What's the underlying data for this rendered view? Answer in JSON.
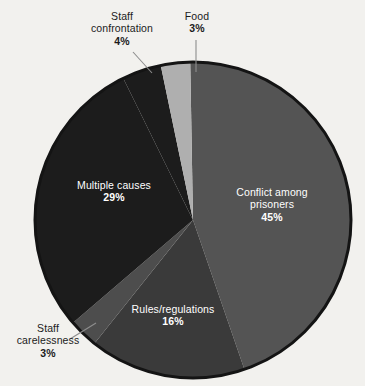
{
  "chart_data": {
    "type": "pie",
    "title": "",
    "subtitle": "",
    "xlabel": "",
    "ylabel": "",
    "legend": "none",
    "grid": false,
    "units": "percent",
    "center": {
      "cx": 193,
      "cy": 220,
      "r": 158
    },
    "start_angle_deg": -1,
    "direction": "clockwise",
    "categories": [
      "Conflict among prisoners",
      "Rules/regulations",
      "Staff carelessness",
      "Multiple causes",
      "Staff confrontation",
      "Food"
    ],
    "values": [
      45,
      16,
      3,
      29,
      4,
      3
    ],
    "slices": [
      {
        "label": "Conflict among\nprisoners",
        "name_line1": "Conflict among",
        "name_line2": "prisoners",
        "value": 45,
        "pct_text": "45%",
        "color": "#545454",
        "label_placement": "inside",
        "label_color": "#ffffff"
      },
      {
        "label": "Rules/regulations",
        "name_line1": "Rules/regulations",
        "name_line2": "",
        "value": 16,
        "pct_text": "16%",
        "color": "#3a3a3a",
        "label_placement": "inside",
        "label_color": "#ffffff"
      },
      {
        "label": "Staff carelessness",
        "name_line1": "Staff",
        "name_line2": "carelessness",
        "value": 3,
        "pct_text": "3%",
        "color": "#4d4d4d",
        "label_placement": "outside",
        "label_color": "#1b1b1b",
        "leader_line": true
      },
      {
        "label": "Multiple causes",
        "name_line1": "Multiple causes",
        "name_line2": "",
        "value": 29,
        "pct_text": "29%",
        "color": "#1c1c1c",
        "label_placement": "inside",
        "label_color": "#ffffff"
      },
      {
        "label": "Staff confrontation",
        "name_line1": "Staff",
        "name_line2": "confrontation",
        "value": 4,
        "pct_text": "4%",
        "color": "#1c1c1c",
        "label_placement": "outside",
        "label_color": "#1b1b1b",
        "leader_line": true
      },
      {
        "label": "Food",
        "name_line1": "Food",
        "name_line2": "",
        "value": 3,
        "pct_text": "3%",
        "color": "#afafaf",
        "label_placement": "outside",
        "label_color": "#1b1b1b",
        "leader_line": true
      }
    ]
  },
  "colors": {
    "background": "#f2f1ee",
    "outline": "#141414",
    "leader_line": "#8d8d8d",
    "slice_conflict": "#545454",
    "slice_rules": "#3a3a3a",
    "slice_staff_carelessness": "#4d4d4d",
    "slice_multiple_causes": "#1c1c1c",
    "slice_staff_confrontation": "#1c1c1c",
    "slice_food": "#afafaf",
    "label_inside_text": "#ffffff",
    "label_outside_text": "#1b1b1b"
  }
}
